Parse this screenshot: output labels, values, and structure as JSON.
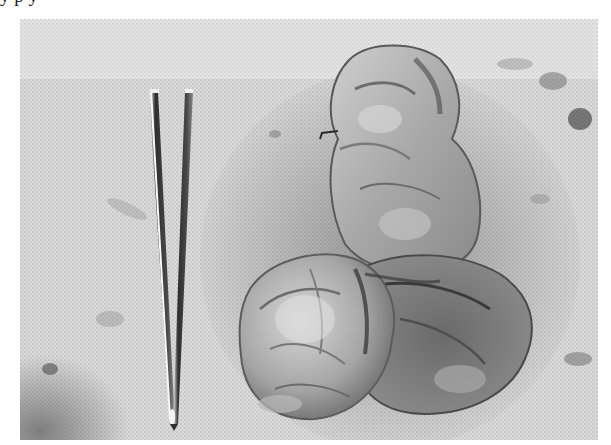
{
  "page": {
    "cropped_header_text": "                                          y                p                    y"
  },
  "figure": {
    "colors": {
      "drape": "#d8d8d8",
      "drape_light": "#e6e6e6",
      "tissue_light": "#c9c9c9",
      "tissue_mid": "#9a9a9a",
      "tissue_dark": "#555555",
      "forceps_dark": "#3a3a3a",
      "forceps_highlight": "#f4f4f4"
    },
    "objects": [
      {
        "name": "forceps",
        "position": "left",
        "orientation": "vertical, tip pointing down"
      },
      {
        "name": "tissue-specimen",
        "position": "center-right",
        "shape": "lobulated mass, narrow upper lobe and wider lower lobe"
      }
    ]
  }
}
